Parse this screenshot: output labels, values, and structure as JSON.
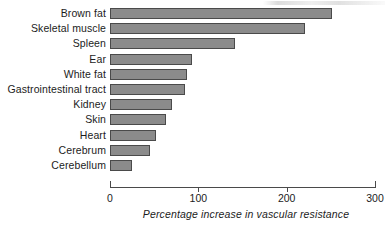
{
  "chart_data": {
    "type": "bar",
    "orientation": "horizontal",
    "title": "",
    "xlabel": "Percentage increase in vascular resistance",
    "ylabel": "",
    "xlim": [
      0,
      300
    ],
    "xticks": [
      0,
      100,
      200,
      300
    ],
    "xtick_labels": [
      "0",
      "100",
      "200",
      "300"
    ],
    "grid": false,
    "legend": null,
    "bar_color": "#8b8b8b",
    "bar_edge_color": "#4a4a4a",
    "axis_color": "#4a4a4a",
    "categories": [
      "Brown fat",
      "Skeletal muscle",
      "Spleen",
      "Ear",
      "White fat",
      "Gastrointestinal tract",
      "Kidney",
      "Skin",
      "Heart",
      "Cerebrum",
      "Cerebellum"
    ],
    "values": [
      251,
      221,
      142,
      93,
      87,
      85,
      70,
      63,
      52,
      45,
      25
    ]
  }
}
